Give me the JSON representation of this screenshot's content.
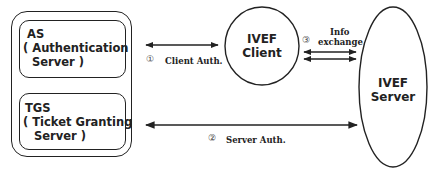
{
  "diagram": {
    "type": "authentication-flow",
    "kerberos_group": {
      "as_box": {
        "title": "AS",
        "line2": "( Authentication",
        "line3": "Server )"
      },
      "tgs_box": {
        "title": "TGS",
        "line2": "( Ticket Granting",
        "line3": "Server )"
      }
    },
    "ivef_client": {
      "line1": "IVEF",
      "line2": "Client"
    },
    "ivef_server": {
      "line1": "IVEF",
      "line2": "Server"
    },
    "edges": [
      {
        "id": 1,
        "marker": "①",
        "label": "Client Auth.",
        "from": "AS",
        "to": "IVEF Client",
        "direction": "bidirectional"
      },
      {
        "id": 2,
        "marker": "②",
        "label": "Server Auth.",
        "from": "TGS",
        "to": "IVEF Server",
        "direction": "bidirectional"
      },
      {
        "id": 3,
        "marker": "③",
        "label_line1": "Info",
        "label_line2": "exchange",
        "from": "IVEF Client",
        "to": "IVEF Server",
        "direction": "bidirectional-double"
      }
    ],
    "colors": {
      "stroke": "#222222",
      "background": "#ffffff"
    }
  }
}
